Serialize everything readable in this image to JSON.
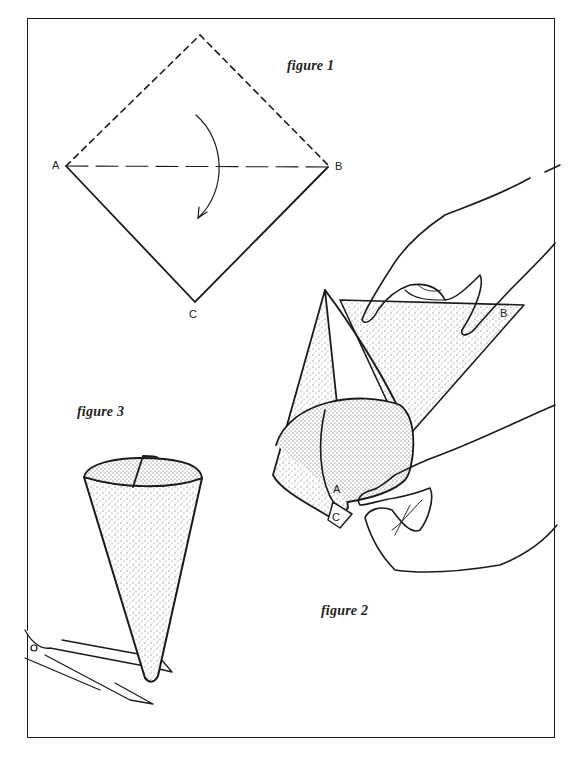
{
  "figures": [
    {
      "id": "figure-1",
      "caption": "figure 1",
      "description": "Square of paper shown as a diamond; top half dashed, folded down along the dashed line A–B onto point C, curved arrow indicates the fold",
      "points": {
        "a": "A",
        "b": "B",
        "c": "C"
      }
    },
    {
      "id": "figure-2",
      "caption": "figure 2",
      "description": "Hands rolling the folded triangle into a cone, corners A and C meeting, B on the outer flap",
      "points": {
        "a": "A",
        "b": "B",
        "c": "C"
      }
    },
    {
      "id": "figure-3",
      "caption": "figure 3",
      "description": "Finished paper cone with scissors snipping the tip"
    }
  ],
  "colors": {
    "ink": "#1a1a1a",
    "paper": "#ffffff",
    "stipple": "#555555"
  }
}
